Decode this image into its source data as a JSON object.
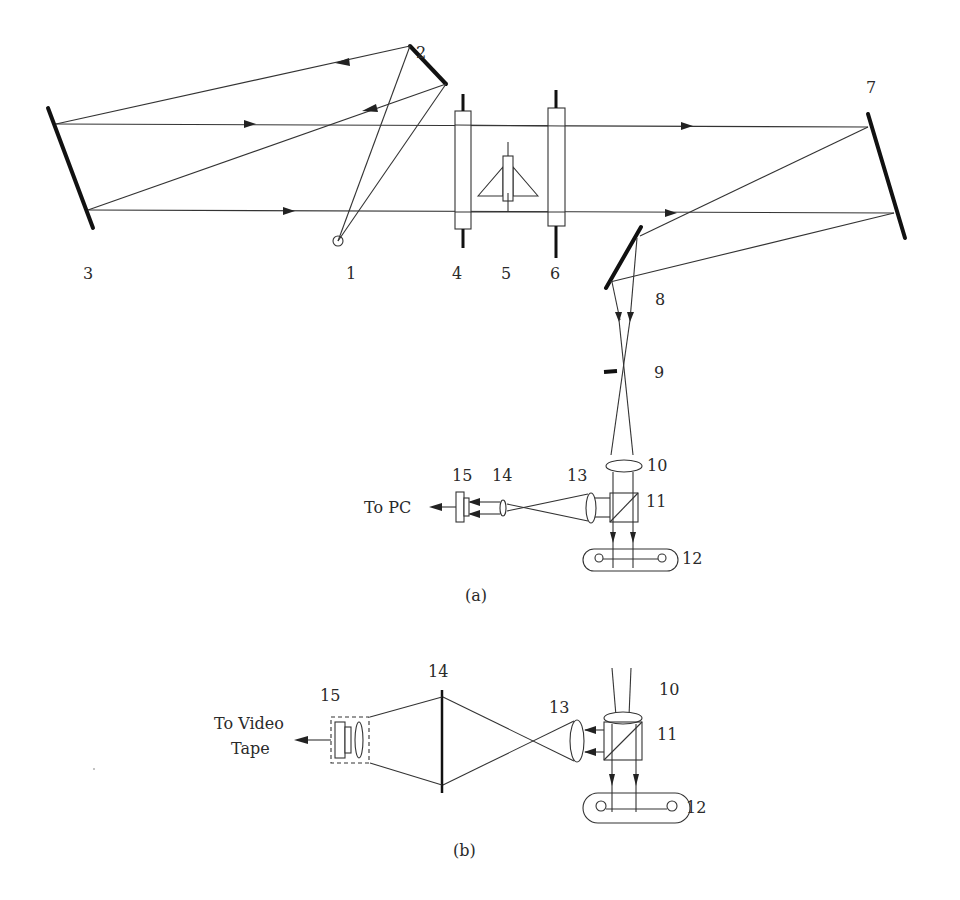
{
  "figure": {
    "type": "optical schematic (schlieren / shadowgraph setup)",
    "panels": [
      {
        "id": "a",
        "caption": "(a)"
      },
      {
        "id": "b",
        "caption": "(b)"
      }
    ]
  },
  "panel_a": {
    "component_labels": {
      "n1": "1",
      "n2": "2",
      "n3": "3",
      "n4": "4",
      "n5": "5",
      "n6": "6",
      "n7": "7",
      "n8": "8",
      "n9": "9",
      "n10": "10",
      "n11": "11",
      "n12": "12",
      "n13": "13",
      "n14": "14",
      "n15": "15"
    },
    "output_label": "To PC",
    "caption": "(a)"
  },
  "panel_b": {
    "component_labels": {
      "n10": "10",
      "n11": "11",
      "n12": "12",
      "n13": "13",
      "n14": "14",
      "n15": "15"
    },
    "output_label_line1": "To Video",
    "output_label_line2": "Tape",
    "caption": "(b)"
  },
  "colors": {
    "line": "#333333",
    "mirror": "#111111",
    "background": "#ffffff"
  }
}
